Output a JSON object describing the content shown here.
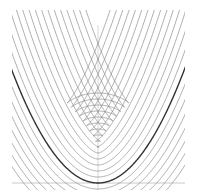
{
  "diagram": {
    "background": "#ffffff",
    "parabola": {
      "vertex_px": [
        98,
        183
      ],
      "a_per_px": 0.0152,
      "color": "#333333",
      "stroke_width": 1.4
    },
    "offsets": {
      "values_px": [
        -6,
        -12,
        -18,
        -24,
        -30,
        -36,
        -42,
        -48,
        -54,
        -60,
        -66,
        -72,
        -78,
        -84,
        -90,
        6,
        12,
        18,
        24,
        30,
        36,
        42
      ],
      "color": "#8a8a8a",
      "stroke_width": 0.7
    },
    "axes": {
      "x_axis_y_px": 183,
      "x_range_px": [
        12,
        185
      ],
      "y_axis_x_px": 98,
      "y_range_px": [
        25,
        190
      ],
      "color": "#bdbdbd"
    },
    "clip": {
      "x": [
        12,
        185
      ],
      "y": [
        10,
        190
      ]
    }
  }
}
